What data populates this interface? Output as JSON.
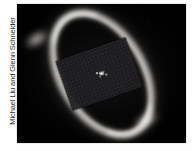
{
  "page": {
    "background_color": "#ffffff",
    "width": 192,
    "height": 151
  },
  "credit": {
    "text": "Michael Liu and Glenn Schneider",
    "orientation": "rotated-90-counterclockwise",
    "color": "#2b2b2b"
  },
  "photo": {
    "alt": "Coronagraphic near-infrared image of an inclined circumstellar debris ring around a star, with a tilted rectangular occulting mask over the center",
    "background_color": "#000000",
    "border_color": "#d8d8d8"
  },
  "features": {
    "ring": {
      "name": "circumstellar-debris-ring",
      "shape": "inclined-ellipse-annulus",
      "position_angle_deg": -31,
      "color": "#ecE9e4"
    },
    "arc_upper": {
      "name": "ring-ansa-upper-left",
      "color": "#fffdf8"
    },
    "arc_lower": {
      "name": "ring-ansa-lower-right",
      "color": "#fffdf8"
    },
    "mask": {
      "name": "occulting-mask",
      "shape": "tilted-rectangle",
      "rotation_deg": -19,
      "color": "#1e1d20"
    },
    "star": {
      "name": "central-star-psf",
      "color": "#ffffff"
    }
  }
}
